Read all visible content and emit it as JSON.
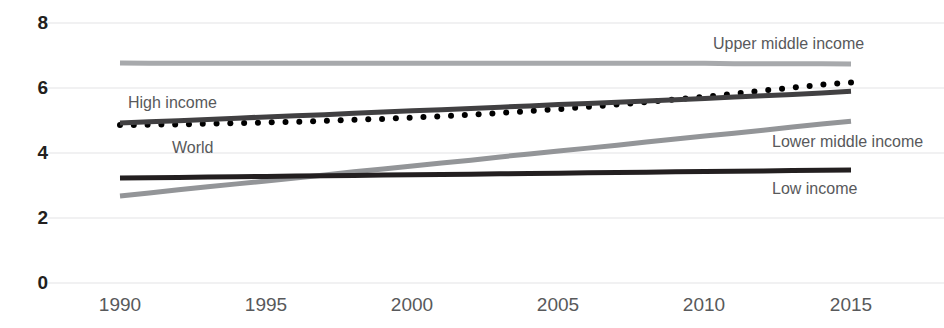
{
  "chart_data": {
    "type": "line",
    "title": "",
    "subtitle": "",
    "xlabel": "",
    "ylabel": "",
    "xlim": [
      1990,
      2015
    ],
    "ylim": [
      0,
      8
    ],
    "grid": "horizontal",
    "legend_position": "inline-labels",
    "x_ticks": [
      "1990",
      "1995",
      "2000",
      "2005",
      "2010",
      "2015"
    ],
    "x_tick_values": [
      1990,
      1995,
      2000,
      2005,
      2010,
      2015
    ],
    "y_ticks": [
      "0",
      "2",
      "4",
      "6",
      "8"
    ],
    "y_tick_values": [
      0,
      2,
      4,
      6,
      8
    ],
    "x": [
      1990,
      1991,
      1992,
      1993,
      1994,
      1995,
      1996,
      1997,
      1998,
      1999,
      2000,
      2001,
      2002,
      2003,
      2004,
      2005,
      2006,
      2007,
      2008,
      2009,
      2010,
      2011,
      2012,
      2013,
      2014,
      2015
    ],
    "series": [
      {
        "name": "Upper middle income",
        "style": "solid",
        "color": "#a7a9ac",
        "width": 5,
        "values": [
          6.77,
          6.76,
          6.76,
          6.76,
          6.76,
          6.76,
          6.76,
          6.76,
          6.76,
          6.76,
          6.76,
          6.76,
          6.76,
          6.76,
          6.76,
          6.76,
          6.76,
          6.76,
          6.76,
          6.76,
          6.76,
          6.75,
          6.75,
          6.75,
          6.75,
          6.74
        ]
      },
      {
        "name": "World",
        "style": "dotted",
        "color": "#000000",
        "width": 6,
        "values": [
          4.86,
          4.87,
          4.88,
          4.9,
          4.92,
          4.94,
          4.96,
          4.99,
          5.02,
          5.05,
          5.09,
          5.13,
          5.18,
          5.23,
          5.29,
          5.35,
          5.42,
          5.49,
          5.57,
          5.65,
          5.73,
          5.82,
          5.92,
          6.01,
          6.1,
          6.17
        ]
      },
      {
        "name": "High income",
        "style": "solid",
        "color": "#414042",
        "width": 5,
        "values": [
          4.92,
          4.96,
          4.99,
          5.03,
          5.07,
          5.11,
          5.15,
          5.18,
          5.22,
          5.26,
          5.3,
          5.33,
          5.37,
          5.41,
          5.45,
          5.49,
          5.52,
          5.56,
          5.6,
          5.64,
          5.68,
          5.72,
          5.76,
          5.8,
          5.85,
          5.9
        ]
      },
      {
        "name": "Lower middle income",
        "style": "solid",
        "color": "#939598",
        "width": 5,
        "values": [
          2.68,
          2.77,
          2.87,
          2.96,
          3.05,
          3.14,
          3.23,
          3.32,
          3.42,
          3.51,
          3.6,
          3.69,
          3.78,
          3.88,
          3.97,
          4.06,
          4.15,
          4.24,
          4.34,
          4.43,
          4.52,
          4.61,
          4.7,
          4.8,
          4.89,
          4.98
        ]
      },
      {
        "name": "Low income",
        "style": "solid",
        "color": "#231f20",
        "width": 5,
        "values": [
          3.23,
          3.24,
          3.25,
          3.26,
          3.27,
          3.28,
          3.29,
          3.3,
          3.31,
          3.32,
          3.33,
          3.34,
          3.35,
          3.36,
          3.37,
          3.38,
          3.39,
          3.4,
          3.41,
          3.42,
          3.43,
          3.44,
          3.45,
          3.46,
          3.47,
          3.48
        ]
      }
    ],
    "annotations": [
      {
        "text": "Upper middle income",
        "x": 713,
        "y": 36
      },
      {
        "text": "High income",
        "x": 128,
        "y": 95
      },
      {
        "text": "World",
        "x": 172,
        "y": 140
      },
      {
        "text": "Lower middle income",
        "x": 772,
        "y": 134
      },
      {
        "text": "Low income",
        "x": 772,
        "y": 181
      }
    ]
  },
  "axis": {
    "y_tick_positions": [
      {
        "label": "0",
        "top": 273
      },
      {
        "label": "2",
        "top": 208
      },
      {
        "label": "4",
        "top": 143
      },
      {
        "label": "6",
        "top": 78
      },
      {
        "label": "8",
        "top": 13
      }
    ],
    "x_tick_positions": [
      {
        "label": "1990",
        "left": 75
      },
      {
        "label": "1995",
        "left": 221
      },
      {
        "label": "2000",
        "left": 367
      },
      {
        "label": "2005",
        "left": 513
      },
      {
        "label": "2010",
        "left": 659
      },
      {
        "label": "2015",
        "left": 806
      }
    ]
  },
  "colors": {
    "background": "#ffffff",
    "gridline": "#ededee",
    "tick_label": "#231f20",
    "x_tick_label": "#58595b",
    "annotation": "#58595b"
  }
}
